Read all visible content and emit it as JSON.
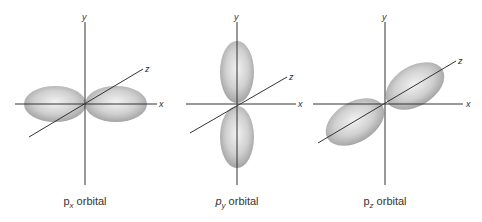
{
  "figure": {
    "panels": [
      {
        "id": "px",
        "caption_main": "p",
        "caption_sub": "x",
        "caption_rest": " orbital",
        "axis_labels": {
          "x": "x",
          "y": "y",
          "z": "z"
        },
        "lobe_orientation": "along x-axis"
      },
      {
        "id": "py",
        "caption_main": "p",
        "caption_sub": "y",
        "caption_rest": " orbital",
        "axis_labels": {
          "x": "x",
          "y": "y",
          "z": "z"
        },
        "lobe_orientation": "along y-axis"
      },
      {
        "id": "pz",
        "caption_main": "p",
        "caption_sub": "z",
        "caption_rest": " orbital",
        "axis_labels": {
          "x": "x",
          "y": "y",
          "z": "z"
        },
        "lobe_orientation": "along z-axis"
      }
    ],
    "colors": {
      "axis": "#333333",
      "lobe_light": "#e8e8e8",
      "lobe_dark": "#9a9a9a",
      "background": "#ffffff"
    }
  }
}
